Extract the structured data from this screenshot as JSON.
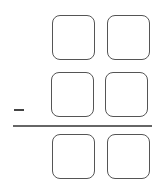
{
  "worksheet": {
    "operation": "subtraction",
    "operator_symbol": "−",
    "digits_per_number": 2,
    "rows": [
      {
        "role": "minuend",
        "boxes": [
          {
            "value": "",
            "left": 52,
            "top": 15,
            "width": 43,
            "height": 45
          },
          {
            "value": "",
            "left": 107,
            "top": 15,
            "width": 43,
            "height": 45
          }
        ]
      },
      {
        "role": "subtrahend",
        "boxes": [
          {
            "value": "",
            "left": 51,
            "top": 72,
            "width": 43,
            "height": 45
          },
          {
            "value": "",
            "left": 105,
            "top": 72,
            "width": 43,
            "height": 45
          }
        ]
      },
      {
        "role": "difference",
        "boxes": [
          {
            "value": "",
            "left": 52,
            "top": 134,
            "width": 43,
            "height": 45
          },
          {
            "value": "",
            "left": 107,
            "top": 134,
            "width": 43,
            "height": 45
          }
        ]
      }
    ],
    "colors": {
      "box_border": "#555555",
      "minus_sign": "#444444",
      "answer_rule": "#666666",
      "background": "#ffffff"
    }
  }
}
